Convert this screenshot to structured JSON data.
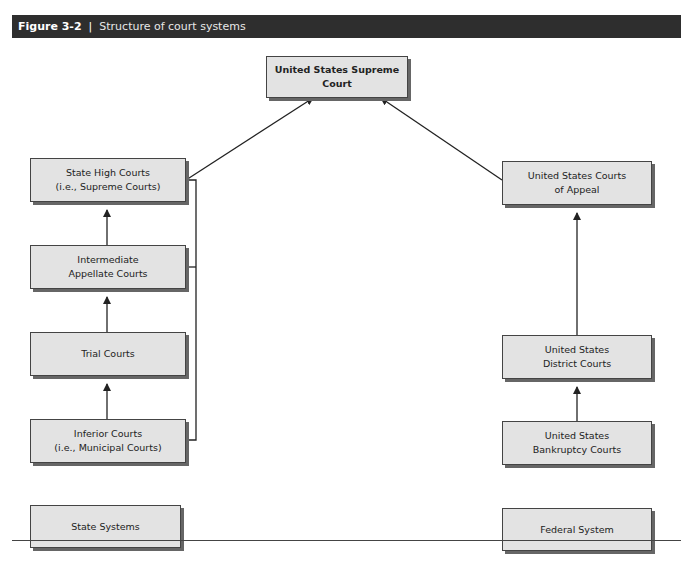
{
  "header": {
    "figure_number": "Figure 3-2",
    "separator": "|",
    "title": "Structure of court systems"
  },
  "nodes": {
    "supreme": {
      "line1": "United States Supreme Court"
    },
    "state_high": {
      "line1": "State High Courts",
      "line2": "(i.e., Supreme Courts)"
    },
    "intermediate": {
      "line1": "Intermediate",
      "line2": "Appellate Courts"
    },
    "trial": {
      "line1": "Trial Courts"
    },
    "inferior": {
      "line1": "Inferior Courts",
      "line2": "(i.e., Municipal Courts)"
    },
    "state_systems": {
      "line1": "State Systems"
    },
    "courts_appeal": {
      "line1": "United States Courts",
      "line2": "of Appeal"
    },
    "district": {
      "line1": "United States",
      "line2": "District Courts"
    },
    "bankruptcy": {
      "line1": "United States",
      "line2": "Bankruptcy Courts"
    },
    "federal_system": {
      "line1": "Federal System"
    }
  }
}
